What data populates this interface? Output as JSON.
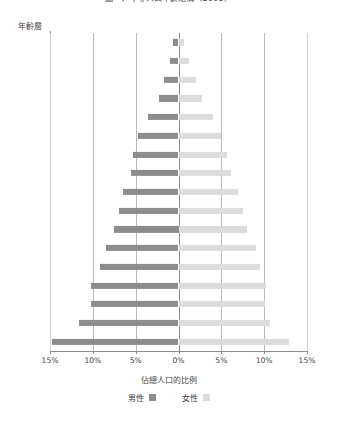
{
  "chart_data": {
    "type": "bar",
    "subtype": "population-pyramid",
    "title": "圖一：中非人口年齡結構（2008）",
    "xlabel": "佔總人口的比例",
    "ylabel": "年齡層",
    "grid": true,
    "legend_position": "bottom",
    "xlim": [
      -15,
      15
    ],
    "xticks": [
      -15,
      -10,
      -5,
      0,
      5,
      10,
      15
    ],
    "xticklabels": [
      "15%",
      "10%",
      "5%",
      "0%",
      "5%",
      "10%",
      "15%"
    ],
    "categories": [
      "80+",
      "75–79",
      "70–74",
      "65–69",
      "60–64",
      "55–59",
      "50–54",
      "45–49",
      "40–44",
      "35–39",
      "30–34",
      "25–29",
      "20–24",
      "15–19",
      "10–14",
      "5–9",
      "0–4"
    ],
    "series": [
      {
        "name": "男性",
        "color": "#8c8c8c",
        "side": "left",
        "values": [
          0.7,
          1.0,
          1.7,
          2.3,
          3.6,
          4.7,
          5.3,
          5.6,
          6.5,
          7.0,
          7.5,
          8.5,
          9.2,
          10.2,
          10.2,
          11.6,
          14.8
        ]
      },
      {
        "name": "女性",
        "color": "#dcdcdc",
        "side": "right",
        "values": [
          0.7,
          1.2,
          2.0,
          2.8,
          4.0,
          5.0,
          5.7,
          6.1,
          7.0,
          7.5,
          8.0,
          9.0,
          9.5,
          10.2,
          10.1,
          10.7,
          12.9
        ]
      }
    ]
  },
  "legend": {
    "male_label": "男性",
    "female_label": "女性"
  }
}
